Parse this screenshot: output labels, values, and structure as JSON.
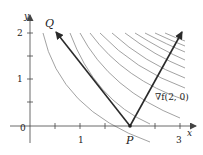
{
  "axes": {
    "x_label": "x",
    "y_label": "y",
    "origin_label": "0",
    "x_ticks": [
      "1",
      "3"
    ],
    "y_ticks": [
      "1",
      "2"
    ]
  },
  "points": {
    "P": "P",
    "Q": "Q"
  },
  "gradient_label": "∇f(2, 0)",
  "colors": {
    "curves": "#8a8a8a",
    "vectors": "#2a2a2a",
    "axes": "#444444"
  }
}
